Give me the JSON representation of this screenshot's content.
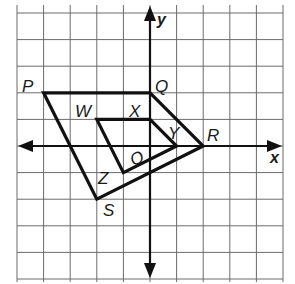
{
  "diagram": {
    "type": "coordinate-grid-dilation",
    "grid": {
      "x_min": -5,
      "x_max": 5,
      "y_min": -5,
      "y_max": 5,
      "cell_px": 26.6,
      "origin_px": [
        150,
        146
      ]
    },
    "axes": {
      "x_label": "x",
      "y_label": "y",
      "origin_label": "O"
    },
    "outer_quadrilateral": {
      "name": "PQRS",
      "vertices": [
        {
          "label": "P",
          "x": -4,
          "y": 2
        },
        {
          "label": "Q",
          "x": 0,
          "y": 2
        },
        {
          "label": "R",
          "x": 2,
          "y": 0
        },
        {
          "label": "S",
          "x": -2,
          "y": -2
        }
      ]
    },
    "inner_quadrilateral": {
      "name": "WXYZ",
      "vertices": [
        {
          "label": "W",
          "x": -2,
          "y": 1
        },
        {
          "label": "X",
          "x": 0,
          "y": 1
        },
        {
          "label": "Y",
          "x": 1,
          "y": 0
        },
        {
          "label": "Z",
          "x": -1,
          "y": -1
        }
      ]
    },
    "colors": {
      "grid": "#6b6b6b",
      "lines": "#111111",
      "background": "#ffffff"
    }
  }
}
